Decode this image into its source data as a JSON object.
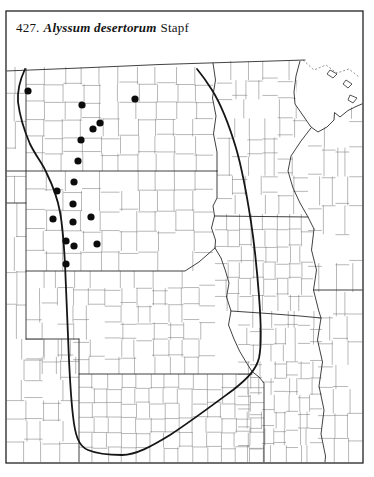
{
  "page": {
    "background": "#ffffff",
    "frame_color": "#222222"
  },
  "title": {
    "number": "427.",
    "species": "Alyssum desertorum",
    "author": "Stapf",
    "full": "427. Alyssum desertorum Stapf"
  },
  "map": {
    "kind": "species-distribution-dot-map",
    "dot_color": "#0c0c0c",
    "dot_radius": 3.6,
    "county_line_color": "#7d7d7d",
    "state_line_color": "#2b2b2b",
    "region_boundary_color": "#161616",
    "occurrence_dots": [
      {
        "x": 28,
        "y": 91
      },
      {
        "x": 82,
        "y": 105
      },
      {
        "x": 135,
        "y": 99
      },
      {
        "x": 100,
        "y": 123
      },
      {
        "x": 93,
        "y": 129
      },
      {
        "x": 81,
        "y": 140
      },
      {
        "x": 78,
        "y": 161
      },
      {
        "x": 74,
        "y": 182
      },
      {
        "x": 57,
        "y": 191
      },
      {
        "x": 73,
        "y": 204
      },
      {
        "x": 53,
        "y": 219
      },
      {
        "x": 73,
        "y": 222
      },
      {
        "x": 91,
        "y": 217
      },
      {
        "x": 66,
        "y": 241
      },
      {
        "x": 74,
        "y": 246
      },
      {
        "x": 97,
        "y": 244
      },
      {
        "x": 66,
        "y": 264
      }
    ]
  }
}
